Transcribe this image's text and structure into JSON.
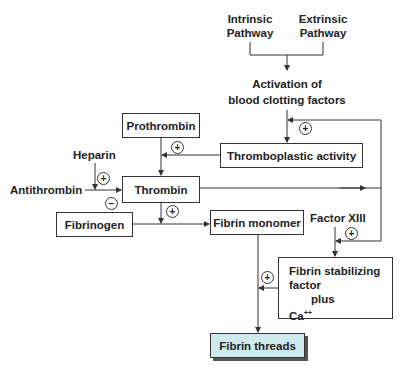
{
  "nodes": {
    "intrinsic": {
      "line1": "Intrinsic",
      "line2": "Pathway"
    },
    "extrinsic": {
      "line1": "Extrinsic",
      "line2": "Pathway"
    },
    "activation": {
      "line1": "Activation of",
      "line2": "blood clotting factors"
    },
    "prothrombin": "Prothrombin",
    "thromboplastic": "Thromboplastic activity",
    "heparin": "Heparin",
    "antithrombin": "Antithrombin",
    "thrombin": "Thrombin",
    "fibrinogen": "Fibrinogen",
    "fibrin_monomer": "Fibrin monomer",
    "factor_xiii": "Factor XIII",
    "stabilizing": {
      "line1": "Fibrin stabilizing",
      "line2": "factor",
      "line3": "plus",
      "line4": "Ca",
      "line4_sup": "++"
    },
    "fibrin_threads": "Fibrin threads"
  },
  "signs": {
    "plus": "+",
    "minus": "−"
  },
  "colors": {
    "final_fill": "#cdeaec",
    "line": "#333333"
  },
  "edges": [
    {
      "from": "Intrinsic Pathway",
      "to": "Activation of blood clotting factors"
    },
    {
      "from": "Extrinsic Pathway",
      "to": "Activation of blood clotting factors"
    },
    {
      "from": "Activation of blood clotting factors",
      "to": "Thromboplastic activity"
    },
    {
      "from": "Thrombin",
      "to": "Thromboplastic activity",
      "sign": "+",
      "type": "feedback"
    },
    {
      "from": "Thromboplastic activity",
      "to": "Prothrombin→Thrombin",
      "sign": "+"
    },
    {
      "from": "Prothrombin",
      "to": "Thrombin"
    },
    {
      "from": "Heparin",
      "to": "Antithrombin→Thrombin",
      "sign": "+"
    },
    {
      "from": "Antithrombin",
      "to": "Thrombin",
      "sign": "−"
    },
    {
      "from": "Thrombin",
      "to": "Fibrinogen→Fibrin monomer",
      "sign": "+"
    },
    {
      "from": "Fibrinogen",
      "to": "Fibrin monomer"
    },
    {
      "from": "Thrombin",
      "to": "Factor XIII→Fibrin stabilizing factor",
      "sign": "+"
    },
    {
      "from": "Factor XIII",
      "to": "Fibrin stabilizing factor plus Ca++"
    },
    {
      "from": "Fibrin stabilizing factor plus Ca++",
      "to": "Fibrin monomer→Fibrin threads",
      "sign": "+"
    },
    {
      "from": "Fibrin monomer",
      "to": "Fibrin threads"
    }
  ]
}
